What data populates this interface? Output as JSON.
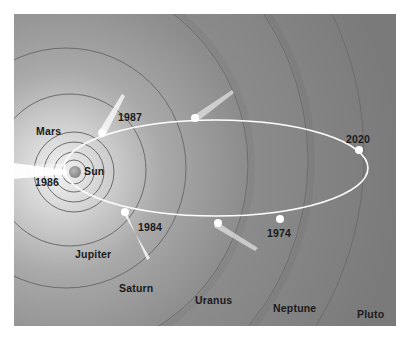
{
  "diagram": {
    "center": {
      "name": "Sun",
      "label": "Sun"
    },
    "planets": [
      {
        "name": "Mars",
        "label": "Mars"
      },
      {
        "name": "Jupiter",
        "label": "Jupiter"
      },
      {
        "name": "Saturn",
        "label": "Saturn"
      },
      {
        "name": "Uranus",
        "label": "Uranus"
      },
      {
        "name": "Neptune",
        "label": "Neptune"
      },
      {
        "name": "Pluto",
        "label": "Pluto"
      }
    ],
    "comet_positions": [
      {
        "year": "1974"
      },
      {
        "year": "1984"
      },
      {
        "year": "1986"
      },
      {
        "year": "1987"
      },
      {
        "year": "2020"
      }
    ],
    "colors": {
      "background": "#7f7f7f",
      "inner_glow": "#e8e8e8",
      "orbit_path": "#ffffff",
      "ring_line": "#6a6a6a",
      "label_text": "#1a1a1a",
      "sun": "#9a9a9a"
    }
  }
}
